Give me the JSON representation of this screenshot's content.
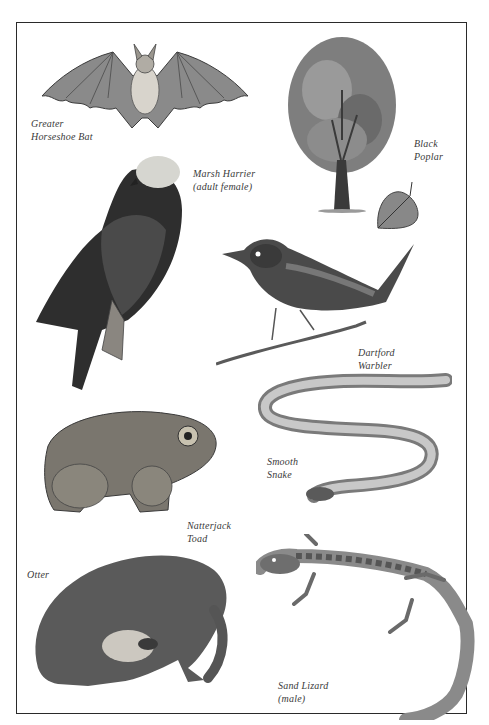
{
  "page": {
    "type": "natural history illustration plate",
    "background": "#ffffff",
    "frame_color": "#2a2a2a"
  },
  "specimens": [
    {
      "id": "bat",
      "name_line1": "Greater",
      "name_line2": "Horseshoe Bat"
    },
    {
      "id": "poplar",
      "name_line1": "Black",
      "name_line2": "Poplar"
    },
    {
      "id": "harrier",
      "name_line1": "Marsh Harrier",
      "name_line2": "(adult female)"
    },
    {
      "id": "warbler",
      "name_line1": "Dartford",
      "name_line2": "Warbler"
    },
    {
      "id": "snake",
      "name_line1": "Smooth",
      "name_line2": "Snake"
    },
    {
      "id": "toad",
      "name_line1": "Natterjack",
      "name_line2": "Toad"
    },
    {
      "id": "otter",
      "name_line1": "Otter",
      "name_line2": ""
    },
    {
      "id": "lizard",
      "name_line1": "Sand Lizard",
      "name_line2": "(male)"
    }
  ]
}
